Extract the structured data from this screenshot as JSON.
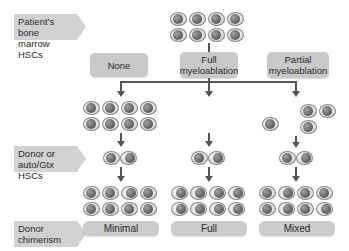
{
  "row_labels": {
    "patient": "Patient's bone marrow HSCs",
    "patient_line1": "Patient's bone",
    "patient_line2": "marrow HSCs",
    "donor_line1": "Donor or",
    "donor_line2": "auto/Gtx HSCs",
    "chimerism_line1": "Donor",
    "chimerism_line2": "chimerism"
  },
  "conditioning": [
    {
      "line1": "None",
      "line2": ""
    },
    {
      "line1": "Full",
      "line2": "myeloablation"
    },
    {
      "line1": "Partial",
      "line2": "myeloablation"
    }
  ],
  "outcomes": [
    "Minimal",
    "Full",
    "Mixed"
  ],
  "colors": {
    "label_bg": "#d2d2d2",
    "box_bg": "#c9c9c9",
    "arrow": "#555555",
    "cell_nucleus": "#6a6a6a"
  }
}
